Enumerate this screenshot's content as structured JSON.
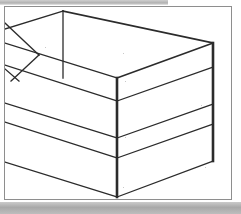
{
  "document": {
    "type": "scanned-figure",
    "title": "Isometric box sketch",
    "background_color": "#ffffff",
    "scan_edge_color": "#b9b9b9"
  },
  "figure": {
    "name": "isometric-open-box-drawing",
    "line_color": "#2b2b2b",
    "border_color": "#8e8e8e",
    "frame": {
      "x": 4,
      "y": 6,
      "width": 228,
      "height": 194
    },
    "vertices": {
      "top_back_left": [
        0,
        22
      ],
      "top_apex": [
        58,
        4
      ],
      "top_back_right": [
        208,
        36
      ],
      "top_front_center": [
        112,
        71
      ],
      "right_lower": [
        208,
        154
      ],
      "center_bottom": [
        112,
        190
      ],
      "left_mid_upper": [
        0,
        58
      ],
      "left_mid_lower": [
        0,
        96
      ],
      "left_low_upper": [
        0,
        115
      ],
      "left_low_lower": [
        0,
        155
      ]
    },
    "segments": [
      {
        "name": "top-edge-left",
        "from": [
          0,
          22
        ],
        "to": [
          58,
          4
        ],
        "weight": "thin"
      },
      {
        "name": "top-edge-right",
        "from": [
          58,
          4
        ],
        "to": [
          208,
          36
        ],
        "weight": "med"
      },
      {
        "name": "top-front-left-edge",
        "from": [
          0,
          36
        ],
        "to": [
          112,
          71
        ],
        "weight": "thin"
      },
      {
        "name": "top-front-right-edge",
        "from": [
          112,
          71
        ],
        "to": [
          208,
          36
        ],
        "weight": "med"
      },
      {
        "name": "vertical-back-left",
        "from": [
          58,
          4
        ],
        "to": [
          58,
          71
        ],
        "weight": "thin"
      },
      {
        "name": "vertical-front-center",
        "from": [
          112,
          71
        ],
        "to": [
          112,
          190
        ],
        "weight": "thick"
      },
      {
        "name": "vertical-right",
        "from": [
          208,
          36
        ],
        "to": [
          208,
          154
        ],
        "weight": "thick"
      },
      {
        "name": "shelf-upper-left",
        "from": [
          0,
          58
        ],
        "to": [
          112,
          94
        ],
        "weight": "thin"
      },
      {
        "name": "shelf-upper-right",
        "from": [
          112,
          94
        ],
        "to": [
          208,
          60
        ],
        "weight": "thin"
      },
      {
        "name": "shelf-lower-left",
        "from": [
          0,
          96
        ],
        "to": [
          112,
          131
        ],
        "weight": "thin"
      },
      {
        "name": "shelf-lower-right",
        "from": [
          112,
          131
        ],
        "to": [
          208,
          97
        ],
        "weight": "thin"
      },
      {
        "name": "base-upper-left",
        "from": [
          0,
          115
        ],
        "to": [
          112,
          151
        ],
        "weight": "thin"
      },
      {
        "name": "base-upper-right",
        "from": [
          112,
          151
        ],
        "to": [
          208,
          117
        ],
        "weight": "thin"
      },
      {
        "name": "base-lower-left",
        "from": [
          0,
          155
        ],
        "to": [
          112,
          190
        ],
        "weight": "thin"
      },
      {
        "name": "base-lower-right",
        "from": [
          112,
          190
        ],
        "to": [
          208,
          154
        ],
        "weight": "thin"
      },
      {
        "name": "corner-diagonal-upper",
        "from": [
          0,
          16
        ],
        "to": [
          34,
          48
        ],
        "weight": "thin"
      },
      {
        "name": "corner-diagonal-lower",
        "from": [
          34,
          48
        ],
        "to": [
          6,
          74
        ],
        "weight": "thin"
      },
      {
        "name": "corner-tick",
        "from": [
          0,
          62
        ],
        "to": [
          14,
          74
        ],
        "weight": "thin"
      }
    ]
  }
}
